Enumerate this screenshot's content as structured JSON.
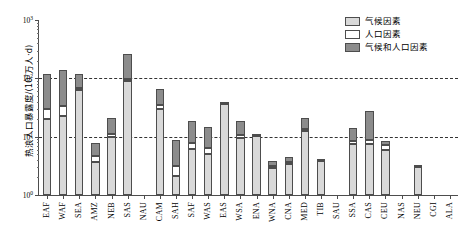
{
  "chart_data": {
    "type": "bar",
    "subtype": "stacked-bar-log",
    "title": "",
    "xlabel": "",
    "ylabel": "热浪人口暴露度/(10⁷万人·d)",
    "ylim": [
      1,
      1000
    ],
    "yscale": "log",
    "ytick_labels": [
      "10⁰",
      "10¹",
      "10²",
      "10³"
    ],
    "ytick_values": [
      1,
      10,
      100,
      1000
    ],
    "gridlines": [
      10,
      100
    ],
    "grid": true,
    "legend_position": "top-right",
    "legend": [
      "气候因素",
      "人口因素",
      "气候和人口因素"
    ],
    "series": [
      {
        "name": "气候因素",
        "key": "climate",
        "color": "#d9d9d9"
      },
      {
        "name": "人口因素",
        "key": "pop",
        "color": "#ffffff"
      },
      {
        "name": "气候和人口因素",
        "key": "both",
        "color": "#8c8c8c"
      }
    ],
    "categories": [
      "EAF",
      "WAF",
      "SEA",
      "AMZ",
      "NEB",
      "SAS",
      "NAU",
      "CAM",
      "SAH",
      "SAF",
      "WAS",
      "EAS",
      "WSA",
      "ENA",
      "WNA",
      "CNA",
      "MED",
      "TIB",
      "SAU",
      "SSA",
      "CAS",
      "CEU",
      "NAS",
      "NEU",
      "CGI",
      "ALA"
    ],
    "values": {
      "climate": [
        20,
        23,
        62,
        3.7,
        9.8,
        90,
        0,
        30,
        2.1,
        6.1,
        5.0,
        36,
        9.5,
        10.5,
        3.0,
        3.5,
        12.5,
        3.8,
        0,
        7.4,
        7.6,
        6.0,
        0,
        3.0,
        0,
        0
      ],
      "pop": [
        10,
        11,
        5.5,
        0.9,
        1.2,
        8.5,
        0,
        5.0,
        1.1,
        1.6,
        1.4,
        4.0,
        1.2,
        0.4,
        0.2,
        0.25,
        1.2,
        0.3,
        0,
        1.0,
        1.3,
        1.3,
        0,
        0.3,
        0,
        0
      ],
      "both": [
        90,
        105,
        50,
        3.2,
        10.0,
        160,
        0,
        30,
        5.5,
        11.0,
        8.0,
        0,
        8.0,
        0,
        0.6,
        0.7,
        7.0,
        0,
        0,
        5.5,
        19.0,
        1.0,
        0,
        0,
        0,
        0
      ]
    },
    "totals": [
      120,
      139,
      117.5,
      7.8,
      21,
      258.5,
      0,
      65,
      8.7,
      18.7,
      14.4,
      40,
      18.7,
      10.9,
      3.8,
      4.45,
      20.7,
      4.1,
      1.0,
      13.9,
      27.9,
      8.3,
      0,
      3.3,
      0,
      0
    ]
  },
  "legend": {
    "items": [
      {
        "label": "气候因素",
        "swatch": "climate"
      },
      {
        "label": "人口因素",
        "swatch": "pop"
      },
      {
        "label": "气候和人口因素",
        "swatch": "both"
      }
    ]
  },
  "axes": {
    "y_title": "热浪人口暴露度/(10⁷万人·d)"
  }
}
